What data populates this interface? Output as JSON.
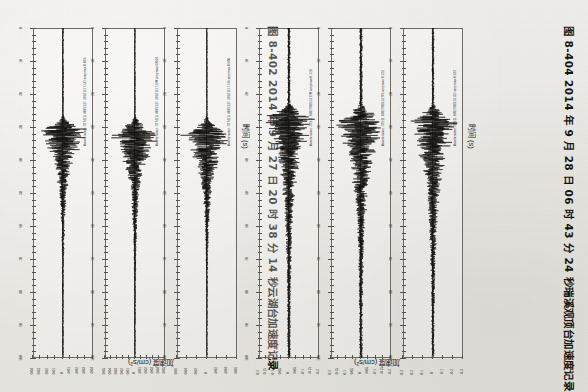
{
  "page": {
    "kind": "scanned-book-page",
    "orientation": "rotated-90-clockwise",
    "background_color": "#eceae6",
    "ink_color": "#15130f"
  },
  "figures": [
    {
      "id": "fig-8-402",
      "caption": "图 8-402  2014 年 9 月 27 日 20 时 38 分 14 秒云湖台加速度记录",
      "caption_number": "图 8-402",
      "caption_text": "2014 年 9 月 27 日 20 时 38 分 14 秒云湖台加速度记录",
      "x_axis_title": "时间 (s)",
      "y_axis_title": "加速度 (cm/s²)",
      "panels": [
        {
          "channel_label": "Acceleration 7DT4(1) 4082137 20141127 UD  ampmax 0.035",
          "component": "UD",
          "amp_ticks": [
            "-0.04",
            "-0.03",
            "-0.02",
            "-0.01",
            "0",
            "0.01",
            "0.02",
            "0.03",
            "0.04"
          ],
          "time_ticks": [
            "0",
            "10",
            "20",
            "30",
            "40",
            "50",
            "60",
            "70",
            "80",
            "90",
            "100"
          ],
          "peak": 0.035,
          "peak_time_s": 31
        },
        {
          "channel_label": "Acceleration 7DT4(1) 4082137 20141127 EW  ampmax 0.048",
          "component": "EW",
          "amp_ticks": [
            "-0.05",
            "-0.04",
            "-0.03",
            "-0.02",
            "-0.01",
            "0",
            "0.01",
            "0.02",
            "0.03",
            "0.04",
            "0.05"
          ],
          "time_ticks": [
            "0",
            "10",
            "20",
            "30",
            "40",
            "50",
            "60",
            "70",
            "80",
            "90",
            "100"
          ],
          "peak": 0.048,
          "peak_time_s": 32
        },
        {
          "channel_label": "Acceleration 7DT4(1) 4082137 20141127 NS  ampmax 0.060",
          "component": "NS",
          "amp_ticks": [
            "-0.06",
            "-0.04",
            "-0.02",
            "0",
            "0.02",
            "0.04",
            "0.06"
          ],
          "time_ticks": [
            "0",
            "10",
            "20",
            "30",
            "40",
            "50",
            "60",
            "70",
            "80",
            "90",
            "100"
          ],
          "peak": 0.06,
          "peak_time_s": 32
        }
      ]
    },
    {
      "id": "fig-8-404",
      "caption": "图 8-404  2014 年 9 月 28 日 06 时 43 分 24 秒瑞溪观顶台加速度记录",
      "caption_number": "图 8-404",
      "caption_text": "2014 年 9 月 28 日 06 时 43 分 24 秒瑞溪观顶台加速度记录",
      "x_axis_title": "时间 (s)",
      "y_axis_title": "加速度 (cm/s²)",
      "panels": [
        {
          "channel_label": "Acceleration 7DS11 6082980123 EW  ampmax 0.228",
          "component": "UD",
          "amp_ticks": [
            "-0.2",
            "-0.15",
            "-0.1",
            "-0.05",
            "0",
            "0.05",
            "0.1",
            "0.15",
            "0.2"
          ],
          "time_ticks": [
            "0",
            "10",
            "20",
            "30",
            "40",
            "50",
            "60",
            "70",
            "80",
            "90",
            "100"
          ],
          "peak": 0.228,
          "peak_time_s": 27
        },
        {
          "channel_label": "Acceleration 7DS11 6082980123 NS  ampmax 0.225",
          "component": "EW",
          "amp_ticks": [
            "-0.2",
            "-0.15",
            "-0.1",
            "-0.05",
            "0",
            "0.05",
            "0.1",
            "0.15",
            "0.2"
          ],
          "time_ticks": [
            "0",
            "10",
            "20",
            "30",
            "40",
            "50",
            "60",
            "70",
            "80",
            "90",
            "100"
          ],
          "peak": 0.225,
          "peak_time_s": 28
        },
        {
          "channel_label": "Acceleration 7DS11 6082980123 UD  ampmax 0.337",
          "component": "NS",
          "amp_ticks": [
            "-0.3",
            "-0.2",
            "-0.1",
            "0",
            "0.1",
            "0.2",
            "0.3"
          ],
          "time_ticks": [
            "0",
            "10",
            "20",
            "30",
            "40",
            "50",
            "60",
            "70",
            "80",
            "90",
            "100"
          ],
          "peak": 0.337,
          "peak_time_s": 28
        }
      ]
    }
  ],
  "chart_data": {
    "type": "line",
    "xlabel": "时间 (s)",
    "ylabel": "加速度 (cm/s²)",
    "grid": false,
    "legend": "none",
    "xlim": [
      0,
      100
    ],
    "charts": [
      {
        "figure": "图 8-402",
        "panel": 1,
        "series_name": "7DT4(1) 4082137 20141127 UD",
        "ylim": [
          -0.04,
          0.04
        ],
        "envelope_peak": 0.035,
        "onset_s": 26,
        "peak_s": 31,
        "coda_end_s": 55,
        "noise_rms": 0.0012
      },
      {
        "figure": "图 8-402",
        "panel": 2,
        "series_name": "7DT4(1) 4082137 20141127 EW",
        "ylim": [
          -0.05,
          0.05
        ],
        "envelope_peak": 0.048,
        "onset_s": 26,
        "peak_s": 32,
        "coda_end_s": 58,
        "noise_rms": 0.0013
      },
      {
        "figure": "图 8-402",
        "panel": 3,
        "series_name": "7DT4(1) 4082137 20141127 NS",
        "ylim": [
          -0.06,
          0.06
        ],
        "envelope_peak": 0.06,
        "onset_s": 26,
        "peak_s": 32,
        "coda_end_s": 58,
        "noise_rms": 0.0014
      },
      {
        "figure": "图 8-404",
        "panel": 1,
        "series_name": "7DS11 6082980123 EW",
        "ylim": [
          -0.2,
          0.2
        ],
        "envelope_peak": 0.228,
        "onset_s": 22,
        "peak_s": 27,
        "coda_end_s": 62,
        "noise_rms": 0.012
      },
      {
        "figure": "图 8-404",
        "panel": 2,
        "series_name": "7DS11 6082980123 NS",
        "ylim": [
          -0.2,
          0.2
        ],
        "envelope_peak": 0.225,
        "onset_s": 22,
        "peak_s": 28,
        "coda_end_s": 64,
        "noise_rms": 0.013
      },
      {
        "figure": "图 8-404",
        "panel": 3,
        "series_name": "7DS11 6082980123 UD",
        "ylim": [
          -0.3,
          0.3
        ],
        "envelope_peak": 0.337,
        "onset_s": 22,
        "peak_s": 28,
        "coda_end_s": 66,
        "noise_rms": 0.015
      }
    ]
  }
}
